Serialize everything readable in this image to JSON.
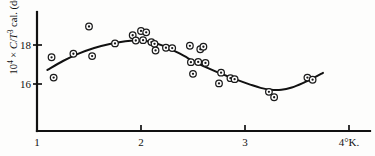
{
  "figure": {
    "axis_title_y": "10⁴ × C/T³ cal. (degree)⁻⁴",
    "x_unit_suffix": "°K."
  },
  "chart_data": {
    "type": "scatter",
    "title": "",
    "xlabel": "°K.",
    "ylabel": "10⁴ × C/T³ cal. (degree)⁻⁴",
    "xlim": [
      1.0,
      4.0
    ],
    "ylim": [
      14.6,
      19.4
    ],
    "xticks": [
      1,
      2,
      3,
      4
    ],
    "xtick_labels": [
      "1",
      "2",
      "3",
      "4°K."
    ],
    "yticks": [
      16,
      18
    ],
    "ytick_labels": [
      "16",
      "18"
    ],
    "grid": false,
    "legend": false,
    "marker_style": "circle-with-center-dot",
    "series": [
      {
        "name": "measured points",
        "points": [
          [
            1.14,
            17.37
          ],
          [
            1.16,
            16.33
          ],
          [
            1.35,
            17.55
          ],
          [
            1.5,
            18.95
          ],
          [
            1.53,
            17.43
          ],
          [
            1.75,
            18.08
          ],
          [
            1.92,
            18.5
          ],
          [
            1.95,
            18.23
          ],
          [
            2.0,
            18.72
          ],
          [
            2.02,
            18.25
          ],
          [
            2.05,
            18.65
          ],
          [
            2.1,
            18.15
          ],
          [
            2.13,
            18.06
          ],
          [
            2.14,
            17.72
          ],
          [
            2.24,
            17.86
          ],
          [
            2.3,
            17.84
          ],
          [
            2.47,
            17.96
          ],
          [
            2.48,
            17.12
          ],
          [
            2.5,
            16.52
          ],
          [
            2.55,
            17.13
          ],
          [
            2.57,
            17.78
          ],
          [
            2.6,
            17.91
          ],
          [
            2.62,
            17.08
          ],
          [
            2.75,
            16.03
          ],
          [
            2.77,
            16.58
          ],
          [
            2.86,
            16.3
          ],
          [
            2.9,
            16.25
          ],
          [
            3.23,
            15.6
          ],
          [
            3.28,
            15.32
          ],
          [
            3.6,
            16.33
          ],
          [
            3.65,
            16.22
          ]
        ]
      },
      {
        "name": "fitted curve",
        "points": [
          [
            1.1,
            16.72
          ],
          [
            1.25,
            17.18
          ],
          [
            1.4,
            17.56
          ],
          [
            1.55,
            17.85
          ],
          [
            1.7,
            18.05
          ],
          [
            1.85,
            18.19
          ],
          [
            1.95,
            18.23
          ],
          [
            2.05,
            18.2
          ],
          [
            2.15,
            18.08
          ],
          [
            2.25,
            17.88
          ],
          [
            2.35,
            17.62
          ],
          [
            2.45,
            17.33
          ],
          [
            2.55,
            17.05
          ],
          [
            2.65,
            16.8
          ],
          [
            2.75,
            16.57
          ],
          [
            2.85,
            16.36
          ],
          [
            2.95,
            16.16
          ],
          [
            3.05,
            15.97
          ],
          [
            3.15,
            15.8
          ],
          [
            3.25,
            15.7
          ],
          [
            3.35,
            15.7
          ],
          [
            3.45,
            15.82
          ],
          [
            3.55,
            16.03
          ],
          [
            3.65,
            16.29
          ],
          [
            3.75,
            16.57
          ]
        ]
      }
    ]
  }
}
